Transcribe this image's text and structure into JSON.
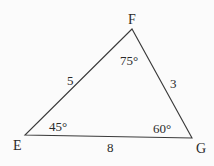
{
  "diagram": {
    "type": "triangle",
    "stroke_color": "#3a3a3a",
    "vertices": [
      {
        "name": "F",
        "x": 132,
        "y": 29,
        "angle": "75°"
      },
      {
        "name": "E",
        "x": 25,
        "y": 135,
        "angle": "45°"
      },
      {
        "name": "G",
        "x": 192,
        "y": 138,
        "angle": "60°"
      }
    ],
    "sides": [
      {
        "between": "EF",
        "length": "5"
      },
      {
        "between": "FG",
        "length": "3"
      },
      {
        "between": "EG",
        "length": "8"
      }
    ]
  },
  "labels": {
    "F": "F",
    "E": "E",
    "G": "G",
    "angle_F": "75°",
    "angle_E": "45°",
    "angle_G": "60°",
    "side_EF": "5",
    "side_FG": "3",
    "side_EG": "8"
  }
}
